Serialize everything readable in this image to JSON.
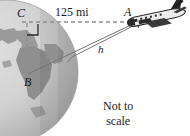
{
  "figure": {
    "width": 190,
    "height": 136,
    "background_color": "#ffffff"
  },
  "labels": {
    "point_c": "C",
    "point_a": "A",
    "point_b": "B",
    "segment_h": "h",
    "distance": "125 mi",
    "note_line1": "Not to",
    "note_line2": "scale"
  },
  "colors": {
    "ocean": "#cfcfcf",
    "ocean_light": "#dedede",
    "land": "#9a9a9a",
    "land_dark": "#8b8b8b",
    "shadow": "#a8a8a8",
    "line": "#6e6e6e",
    "dashed_line": "#9b9b9b",
    "text": "#1a1a1a",
    "plane_dark": "#2b2b2b",
    "plane_light": "#e9e9e9"
  },
  "geometry": {
    "globe_center_x": 6,
    "globe_center_y": 72,
    "globe_radius": 72,
    "horizontal_dashed_y": 22,
    "horizontal_dashed_x_start": 22,
    "horizontal_dashed_x_end": 131,
    "plane_point_x": 131,
    "plane_point_y": 24,
    "right_angle_marker": true
  },
  "elements": {
    "globe_name": "earth-globe",
    "plane_name": "airplane-icon",
    "dashed_horizontal_name": "dashed-horizon-line",
    "dashed_vertical_name": "dashed-radius-line",
    "tangent_line_name": "tangent-line-segment-h",
    "radius_line_name": "line-a-to-b"
  }
}
